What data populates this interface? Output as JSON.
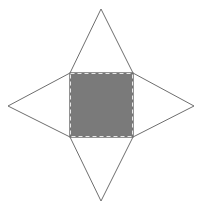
{
  "figure": {
    "caption_partial": "",
    "base": {
      "x": 70,
      "y": 73,
      "width": 63,
      "height": 64,
      "fill": "#7a7a7a",
      "border": "dashed",
      "border_color": "#ffffff"
    },
    "triangles": {
      "top": {
        "apex": [
          101,
          9
        ]
      },
      "bottom": {
        "apex": [
          101,
          201
        ]
      },
      "left": {
        "apex": [
          8,
          106
        ]
      },
      "right": {
        "apex": [
          194,
          106
        ]
      }
    },
    "line_color": "#6e6e6e"
  }
}
